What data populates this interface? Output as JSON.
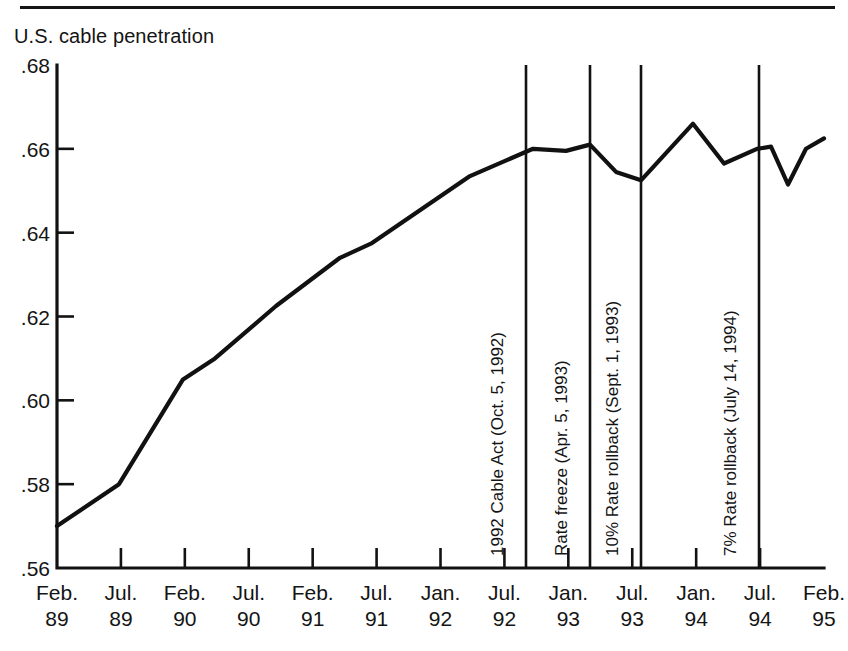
{
  "figure": {
    "series_label": "U.S. cable penetration",
    "has_top_rule": true,
    "line_color": "#111111",
    "axis_color": "#121212",
    "background": "#ffffff"
  },
  "chart_data": {
    "type": "line",
    "title": "U.S. cable penetration",
    "xlabel": "",
    "ylabel": "U.S. cable penetration",
    "ylim": [
      0.56,
      0.68
    ],
    "ytick_labels": [
      ".68",
      ".66",
      ".64",
      ".62",
      ".60",
      ".58",
      ".56"
    ],
    "ytick_values": [
      0.68,
      0.66,
      0.64,
      0.62,
      0.6,
      0.58,
      0.56
    ],
    "grid": false,
    "legend": "none",
    "xtick_labels": [
      {
        "month": "Feb.",
        "year": "89"
      },
      {
        "month": "Jul.",
        "year": "89"
      },
      {
        "month": "Feb.",
        "year": "90"
      },
      {
        "month": "Jul.",
        "year": "90"
      },
      {
        "month": "Feb.",
        "year": "91"
      },
      {
        "month": "Jul.",
        "year": "91"
      },
      {
        "month": "Jan.",
        "year": "92"
      },
      {
        "month": "Jul.",
        "year": "92"
      },
      {
        "month": "Jan.",
        "year": "93"
      },
      {
        "month": "Jul.",
        "year": "93"
      },
      {
        "month": "Jan.",
        "year": "94"
      },
      {
        "month": "Jul.",
        "year": "94"
      },
      {
        "month": "Feb.",
        "year": "95"
      }
    ],
    "x": [
      "Feb. 89",
      "Jul. 89",
      "Feb. 90",
      "Jul. 90",
      "Feb. 91",
      "Jul. 91",
      "Jan. 92",
      "Jul. 92",
      "Oct. 92",
      "Jan. 93",
      "Apr. 93",
      "Jul. 93",
      "Sept. 93",
      "Oct. 93",
      "Jan. 94",
      "Apr. 94",
      "Jul. 94",
      "Sept. 94",
      "Nov. 94",
      "Feb. 95"
    ],
    "values": [
      0.57,
      0.58,
      0.605,
      0.61,
      0.6225,
      0.634,
      0.6375,
      0.6535,
      0.66,
      0.6595,
      0.661,
      0.6545,
      0.6525,
      0.666,
      0.6565,
      0.66,
      0.6605,
      0.6515,
      0.66,
      0.6625
    ],
    "annotations": [
      {
        "label": "1992 Cable Act (Oct. 5, 1992)",
        "x": "Oct. 5, 1992"
      },
      {
        "label": "Rate freeze (Apr. 5, 1993)",
        "x": "Apr. 5, 1993"
      },
      {
        "label": "10% Rate rollback (Sept. 1, 1993)",
        "x": "Sept. 1, 1993"
      },
      {
        "label": "7% Rate rollback (July 14, 1994)",
        "x": "July 14, 1994"
      }
    ]
  }
}
